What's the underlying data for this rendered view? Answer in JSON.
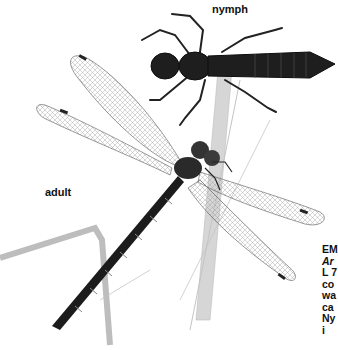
{
  "labels": {
    "nymph": "nymph",
    "adult": "adult"
  },
  "caption": {
    "title": "EM",
    "scientific": "Ar",
    "lines": [
      "L 7",
      "co",
      "wa",
      "ca",
      "Ny",
      "i"
    ]
  },
  "illustration": {
    "subject": "dragonfly adult and nymph on reed stems",
    "colors": {
      "body": "#1a1a1a",
      "wing_vein": "#555555",
      "reed": "#b8b8b8",
      "background": "#ffffff"
    }
  }
}
